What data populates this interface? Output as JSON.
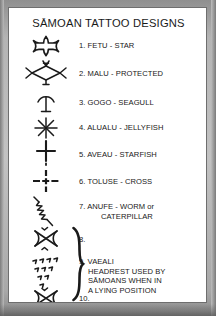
{
  "page": {
    "title": "SĀMOAN TATTOO DESIGNS",
    "background_color": "#a6a6a6",
    "panel_color": "#ffffff",
    "ink_color": "#181818"
  },
  "entries": [
    {
      "number": "1.",
      "label": "1. FETU - STAR",
      "name": "FETU",
      "meaning": "STAR",
      "symbol": "four-pointed-star-glyph"
    },
    {
      "number": "2.",
      "label": "2. MALU - PROTECTED",
      "name": "MALU",
      "meaning": "PROTECTED",
      "symbol": "diamond-with-barbs-glyph"
    },
    {
      "number": "3.",
      "label": "3. GOGO - SEAGULL",
      "name": "GOGO",
      "meaning": "SEAGULL",
      "symbol": "seagull-y-glyph"
    },
    {
      "number": "4.",
      "label": "4. ALUALU - JELLYFISH",
      "name": "ALUALU",
      "meaning": "JELLYFISH",
      "symbol": "asterisk-jellyfish-glyph"
    },
    {
      "number": "5.",
      "label": "5. AVEAU - STARFISH",
      "name": "AVEAU",
      "meaning": "STARFISH",
      "symbol": "starfish-cross-glyph"
    },
    {
      "number": "6.",
      "label": "6. TOLUSE - CROSS",
      "name": "TOLUSE",
      "meaning": "CROSS",
      "symbol": "dashed-cross-glyph"
    },
    {
      "number": "7.",
      "label_line1": "7. ANUFE - WORM or",
      "label_line2": "CATERPILLAR",
      "name": "ANUFE",
      "meaning": "WORM or CATERPILLAR",
      "symbol": "diagonal-zigzag-glyph"
    },
    {
      "number": "8.",
      "label": "8.",
      "symbol": "bowtie-x-glyph"
    },
    {
      "number": "9.",
      "label_line1": "9. VAEALI",
      "label_line2": "HEADREST USED BY",
      "label_line3": "SĀMOANS WHEN IN",
      "label_line4": "A LYING POSITION",
      "name": "VAEALI",
      "meaning": "HEADREST USED BY SĀMOANS WHEN IN A LYING POSITION",
      "symbol": "tick-cluster-glyph"
    },
    {
      "number": "10.",
      "label": "10.",
      "symbol": "bowtie-x-glyph"
    }
  ],
  "grouping": {
    "brace_symbol": "curly-brace-right",
    "covers": [
      "8.",
      "9.",
      "10."
    ]
  }
}
